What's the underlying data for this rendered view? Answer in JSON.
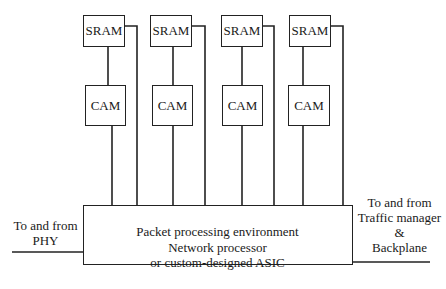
{
  "diagram": {
    "units": [
      {
        "sram_label": "SRAM",
        "cam_label": "CAM"
      },
      {
        "sram_label": "SRAM",
        "cam_label": "CAM"
      },
      {
        "sram_label": "SRAM",
        "cam_label": "CAM"
      },
      {
        "sram_label": "SRAM",
        "cam_label": "CAM"
      }
    ],
    "main_block": {
      "line1": "Packet processing environment",
      "line2": "Network processor",
      "line3": "or custom-designed ASIC"
    },
    "left_interface": {
      "line1": "To and from",
      "line2": "PHY"
    },
    "right_interface": {
      "line1": "To and from",
      "line2": "Traffic manager",
      "line3": "&",
      "line4": "Backplane"
    },
    "line_color": "#222222"
  }
}
